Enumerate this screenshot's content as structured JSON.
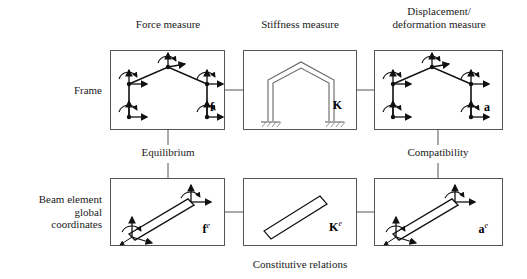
{
  "diagram": {
    "column_headers": [
      {
        "id": "force",
        "text": "Force measure"
      },
      {
        "id": "stiffness",
        "text": "Stiffness measure"
      },
      {
        "id": "displacement",
        "text": "Displacement/\ndeformation measure"
      }
    ],
    "row_labels": [
      {
        "id": "frame",
        "text": "Frame"
      },
      {
        "id": "beam-element",
        "text": "Beam element\nglobal\ncoordinates"
      }
    ],
    "connector_labels": [
      {
        "id": "equilibrium",
        "text": "Equilibrium"
      },
      {
        "id": "compatibility",
        "text": "Compatibility"
      },
      {
        "id": "constitutive",
        "text": "Constitutive relations"
      }
    ],
    "cells": [
      {
        "id": "frame-force",
        "symbol": "f",
        "superscript": "",
        "graphic": "frame-with-nodal-forces"
      },
      {
        "id": "frame-stiffness",
        "symbol": "K",
        "superscript": "",
        "graphic": "frame-fixed-supports"
      },
      {
        "id": "frame-displacement",
        "symbol": "a",
        "superscript": "",
        "graphic": "frame-with-nodal-displacements"
      },
      {
        "id": "element-force",
        "symbol": "f",
        "superscript": "e",
        "graphic": "inclined-beam-with-end-forces"
      },
      {
        "id": "element-stiffness",
        "symbol": "K",
        "superscript": "e",
        "graphic": "inclined-beam"
      },
      {
        "id": "element-displacement",
        "symbol": "a",
        "superscript": "e",
        "graphic": "inclined-beam-with-end-displacements"
      }
    ],
    "colors": {
      "ink": "#1a1a1a",
      "box_border": "#555555",
      "connector": "#555555",
      "background": "#ffffff"
    }
  }
}
